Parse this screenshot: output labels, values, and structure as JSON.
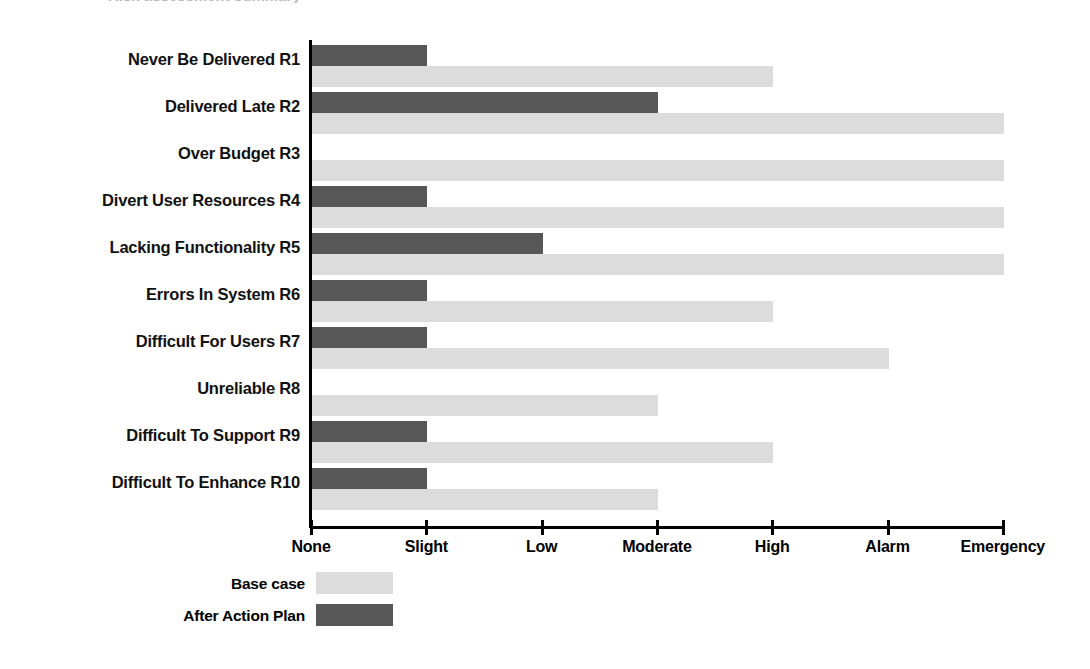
{
  "title_remnant": "Risk assessment summary",
  "chart_data": {
    "type": "bar",
    "orientation": "horizontal",
    "title": "",
    "xlabel": "",
    "ylabel": "",
    "grid": false,
    "legend_position": "bottom-left",
    "categories": [
      "Never Be Delivered R1",
      "Delivered Late R2",
      "Over Budget  R3",
      "Divert User Resources R4",
      "Lacking Functionality R5",
      "Errors In System R6",
      "Difficult For Users R7",
      "Unreliable R8",
      "Difficult To Support R9",
      "Difficult To Enhance R10"
    ],
    "x_tick_labels": [
      "None",
      "Slight",
      "Low",
      "Moderate",
      "High",
      "Alarm",
      "Emergency"
    ],
    "x_tick_values": [
      0,
      1,
      2,
      3,
      4,
      5,
      6
    ],
    "xlim": [
      0,
      6
    ],
    "series": [
      {
        "name": "Base case",
        "color": "#dcdcdc",
        "values": [
          4,
          6,
          6,
          6,
          6,
          4,
          5,
          3,
          4,
          3
        ],
        "value_labels": [
          "High",
          "Emergency",
          "Emergency",
          "Emergency",
          "Emergency",
          "High",
          "Alarm",
          "Moderate",
          "High",
          "Moderate"
        ]
      },
      {
        "name": "After Action Plan",
        "color": "#575757",
        "values": [
          1,
          3,
          0,
          1,
          2,
          1,
          1,
          0,
          1,
          1
        ],
        "value_labels": [
          "Slight",
          "Moderate",
          "None",
          "Slight",
          "Low",
          "Slight",
          "Slight",
          "None",
          "Slight",
          "Slight"
        ]
      }
    ]
  },
  "legend": {
    "items": [
      {
        "label": "Base case",
        "color": "#dcdcdc"
      },
      {
        "label": "After Action Plan",
        "color": "#575757"
      }
    ]
  }
}
